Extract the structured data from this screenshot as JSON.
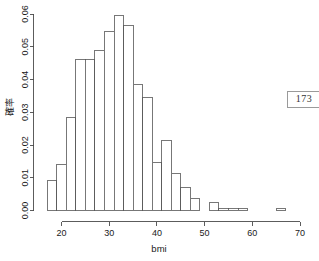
{
  "page_badge": {
    "label": "173"
  },
  "chart_data": {
    "type": "bar",
    "title": "",
    "subtitle": "",
    "xlabel": "bmi",
    "ylabel": "確率",
    "xlim": [
      16.0,
      70.0
    ],
    "ylim": [
      0.0,
      0.06
    ],
    "grid": false,
    "legend": null,
    "bin_width": 2,
    "xticks": [
      20,
      30,
      40,
      50,
      60,
      70
    ],
    "xtick_labels": [
      "20",
      "30",
      "40",
      "50",
      "60",
      "70"
    ],
    "yticks": [
      0.0,
      0.01,
      0.02,
      0.03,
      0.04,
      0.05,
      0.06
    ],
    "ytick_labels": [
      "0.00",
      "0.01",
      "0.02",
      "0.03",
      "0.04",
      "0.05",
      "0.06"
    ],
    "bin_edges": [
      17,
      19,
      21,
      23,
      25,
      27,
      29,
      31,
      33,
      35,
      37,
      39,
      41,
      43,
      45,
      47,
      49,
      51,
      53,
      55,
      57,
      59,
      61,
      63,
      65,
      67,
      69
    ],
    "categories": [
      "17-19",
      "19-21",
      "21-23",
      "23-25",
      "25-27",
      "27-29",
      "29-31",
      "31-33",
      "33-35",
      "35-37",
      "37-39",
      "39-41",
      "41-43",
      "43-45",
      "45-47",
      "47-49",
      "49-51",
      "51-53",
      "53-55",
      "55-57",
      "57-59",
      "59-61",
      "61-63",
      "63-65",
      "65-67",
      "67-69"
    ],
    "values": [
      0.0093,
      0.014,
      0.0285,
      0.0462,
      0.0461,
      0.0489,
      0.0546,
      0.0594,
      0.0566,
      0.0386,
      0.0346,
      0.0148,
      0.0213,
      0.0114,
      0.0071,
      0.0038,
      0.0,
      0.0024,
      0.0005,
      0.0006,
      0.0006,
      0.0,
      0.0,
      0.0,
      0.0006,
      0.0
    ]
  }
}
